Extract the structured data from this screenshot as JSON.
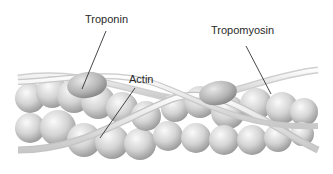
{
  "diagram": {
    "labels": {
      "troponin": "Troponin",
      "tropomyosin": "Tropomyosin",
      "actin": "Actin"
    },
    "colors": {
      "background": "#ffffff",
      "bead_light": "#f2f2f2",
      "bead_dark": "#9a9a9a",
      "strand": "#e6e6e6",
      "leader_line": "#333333",
      "text": "#2a2a2a"
    }
  }
}
